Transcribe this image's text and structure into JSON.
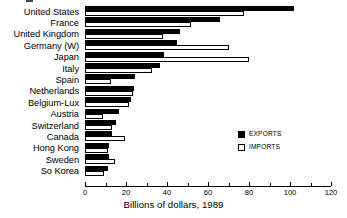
{
  "chart_data": {
    "type": "bar",
    "orientation": "horizontal",
    "title": "",
    "xlabel": "Billions of dollars, 1989",
    "ylabel": "",
    "xlim": [
      0,
      120
    ],
    "xticks": [
      0,
      20,
      40,
      60,
      80,
      100,
      120
    ],
    "xtick_labels": [
      "0",
      "20",
      "40",
      "60",
      "80",
      "100",
      "120"
    ],
    "minor_xticks": [
      10,
      30,
      50,
      70,
      90,
      110
    ],
    "grid": false,
    "legend_position": "center-right",
    "categories": [
      "United States",
      "France",
      "United Kingdom",
      "Germany (W)",
      "Japan",
      "Italy",
      "Spain",
      "Netherlands",
      "Belgium-Lux",
      "Austria",
      "Switzerland",
      "Canada",
      "Hong Kong",
      "Sweden",
      "So Korea"
    ],
    "series": [
      {
        "name": "EXPORTS",
        "color": "#000000",
        "values": [
          102,
          66,
          46.5,
          45,
          38.5,
          36.5,
          24.5,
          24,
          22.5,
          16.5,
          15,
          13,
          11.5,
          11.5,
          11
        ]
      },
      {
        "name": "IMPORTS",
        "color": "#ffffff",
        "values": [
          77.5,
          51.5,
          38,
          70,
          80,
          32.5,
          12.5,
          23.5,
          21.5,
          9,
          13,
          19.5,
          11,
          14.5,
          9.5
        ]
      }
    ]
  },
  "legend": {
    "items": [
      {
        "label": "EXPORTS",
        "style": "filled"
      },
      {
        "label": "IMPORTS",
        "style": "outline"
      }
    ]
  },
  "axis": {
    "title": "Billions of dollars, 1989"
  }
}
